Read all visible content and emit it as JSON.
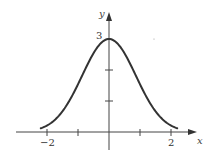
{
  "chart_data": {
    "type": "line",
    "title": "",
    "xlabel": "x",
    "ylabel": "y",
    "function_description": "bell-shaped curve, approx y = 3·e^(-x²/1.5)",
    "x": [
      -2.2,
      -2.0,
      -1.5,
      -1.0,
      -0.5,
      0.0,
      0.5,
      1.0,
      1.5,
      2.0,
      2.2
    ],
    "series": [
      {
        "name": "curve",
        "values": [
          0.12,
          0.2,
          0.67,
          1.54,
          2.53,
          3.0,
          2.53,
          1.54,
          0.67,
          0.2,
          0.12
        ]
      }
    ],
    "xlim": [
      -3,
      3
    ],
    "ylim": [
      0,
      3.4
    ],
    "x_ticks": [
      -2,
      -1,
      1,
      2
    ],
    "x_tick_labels": [
      "−2",
      "",
      "",
      "2"
    ],
    "y_ticks": [
      1,
      2,
      3
    ],
    "y_tick_labels": [
      "",
      "",
      "3"
    ],
    "grid": false,
    "legend": null,
    "colors": {
      "curve": "#333333",
      "axes": "#444444"
    }
  },
  "labels": {
    "x_axis": "x",
    "y_axis": "y",
    "y_max": "3",
    "x_neg2": "−2",
    "x_pos2": "2"
  }
}
